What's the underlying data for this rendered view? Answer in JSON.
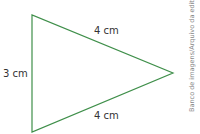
{
  "diagram": {
    "shape": "triangle",
    "stroke_color": "#3f8f4a",
    "vertices": [
      [
        32,
        15
      ],
      [
        32,
        132
      ],
      [
        173,
        73
      ]
    ],
    "sides": {
      "left": "3 cm",
      "top": "4 cm",
      "bottom": "4 cm"
    }
  },
  "credit": "Banco de imagens/Arquivo da editora"
}
